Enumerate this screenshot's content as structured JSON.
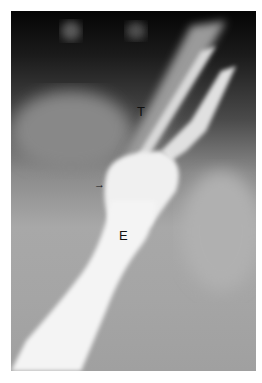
{
  "figure": {
    "type": "radiograph",
    "labels": [
      {
        "id": "trachea",
        "text": "T"
      },
      {
        "id": "esophagus",
        "text": "E"
      }
    ],
    "arrow": {
      "glyph": "→"
    }
  }
}
